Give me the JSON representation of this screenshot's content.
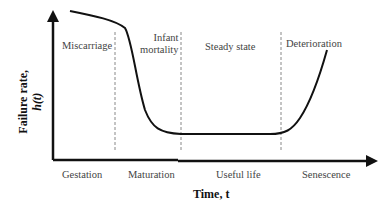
{
  "diagram": {
    "type": "bathtub-curve",
    "y_axis": {
      "label_line1": "Failure rate,",
      "label_line2": "h(t)"
    },
    "x_axis": {
      "label": "Time, t"
    },
    "regions_top": [
      {
        "label": "Miscarriage"
      },
      {
        "label_line1": "Infant",
        "label_line2": "mortality"
      },
      {
        "label": "Steady state"
      },
      {
        "label": "Deterioration"
      }
    ],
    "phases_bottom": [
      {
        "label": "Gestation"
      },
      {
        "label": "Maturation"
      },
      {
        "label": "Useful life"
      },
      {
        "label": "Senescence"
      }
    ],
    "colors": {
      "curve": "#111111",
      "axis": "#111111",
      "divider": "#888888"
    }
  }
}
